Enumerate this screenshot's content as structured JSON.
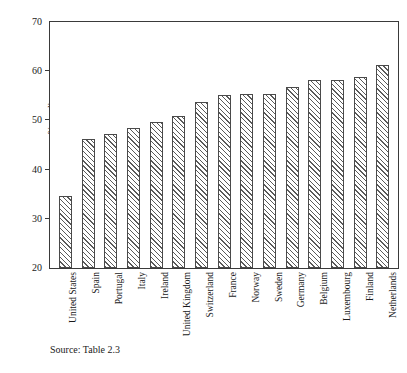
{
  "chart_data": {
    "type": "bar",
    "title": "",
    "subtitle": "",
    "xlabel": "",
    "ylabel": "% median",
    "ylim": [
      20,
      70
    ],
    "yticks": [
      20,
      30,
      40,
      50,
      60,
      70
    ],
    "ytick_labels": [
      "20",
      "30",
      "40",
      "50",
      "60",
      "70"
    ],
    "grid": false,
    "legend": null,
    "categories": [
      "United States",
      "Spain",
      "Portugal",
      "Italy",
      "Ireland",
      "United Kingdom",
      "Switzerland",
      "France",
      "Norway",
      "Sweden",
      "Germany",
      "Belgium",
      "Luxembourg",
      "Finland",
      "Netherlands"
    ],
    "values": [
      34.6,
      46.3,
      47.3,
      48.5,
      49.6,
      50.8,
      53.8,
      55.2,
      55.3,
      55.4,
      56.8,
      58.2,
      58.3,
      58.8,
      61.3
    ],
    "bar_style": {
      "fill": "hatched-diagonal",
      "edge_color": "#4a4a4a",
      "face_color": "#ffffff"
    }
  },
  "annotations": {
    "source_note": "Source: Table 2.3"
  }
}
